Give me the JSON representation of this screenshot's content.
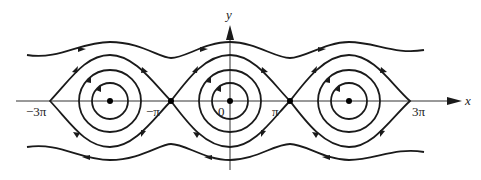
{
  "diagram": {
    "type": "phase-portrait",
    "axes": {
      "x_label": "x",
      "y_label": "y"
    },
    "tick_labels": [
      "−3π",
      "−π",
      "0",
      "π",
      "3π"
    ],
    "equilibria": {
      "centers": [
        "-2π",
        "0",
        "2π"
      ],
      "saddles": [
        "-π",
        "π"
      ]
    },
    "colors": {
      "stroke": "#1a1a1a",
      "axis": "#333333",
      "background": "#ffffff"
    }
  }
}
